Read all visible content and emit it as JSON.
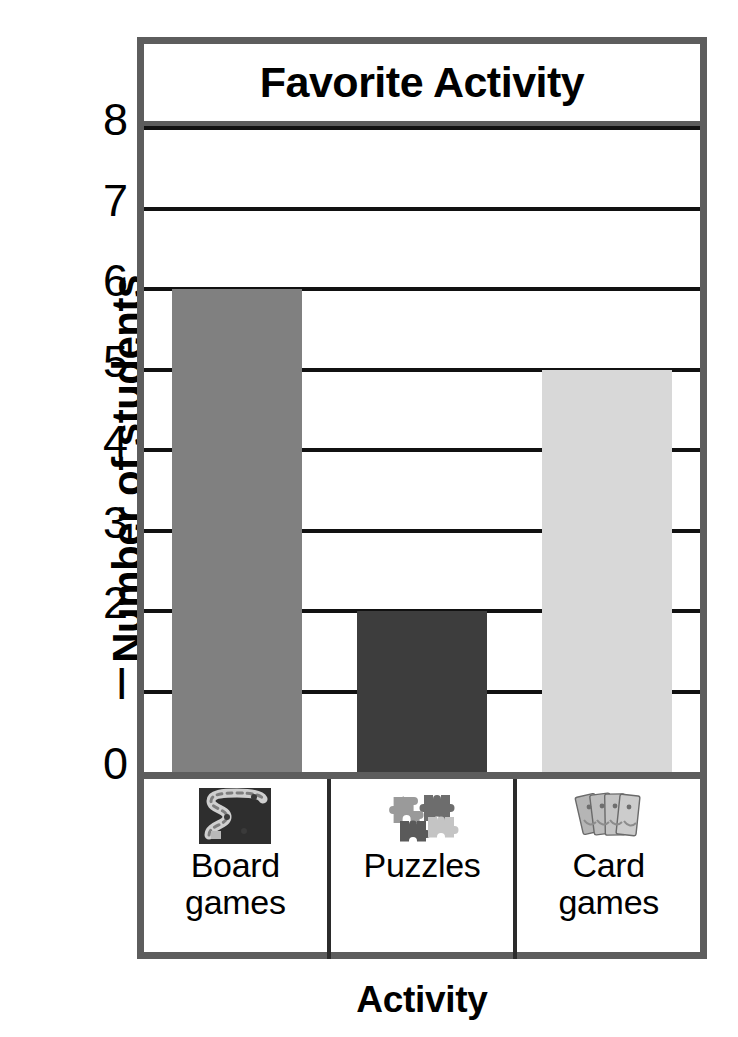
{
  "chart_data": {
    "type": "bar",
    "title": "Favorite Activity",
    "xlabel": "Activity",
    "ylabel": "Number of students",
    "categories": [
      "Board games",
      "Puzzles",
      "Card games"
    ],
    "values": [
      6,
      2,
      5
    ],
    "ylim": [
      0,
      8
    ],
    "ytick_labels": [
      "0",
      "I",
      "2",
      "3",
      "4",
      "5",
      "6",
      "7",
      "8"
    ],
    "ytick_values": [
      0,
      1,
      2,
      3,
      4,
      5,
      6,
      7,
      8
    ],
    "grid": true,
    "legend": "none",
    "bar_colors": [
      "#808080",
      "#3d3d3d",
      "#d8d8d8"
    ],
    "category_icons": [
      "board-game-icon",
      "puzzle-pieces-icon",
      "playing-cards-icon"
    ],
    "category_label_lines": [
      [
        "Board",
        "games"
      ],
      [
        "Puzzles"
      ],
      [
        "Card",
        "games"
      ]
    ]
  },
  "style": {
    "frame_color": "#5d5d5d",
    "gridline_color": "#111111",
    "background": "#ffffff",
    "text_color": "#000000"
  }
}
